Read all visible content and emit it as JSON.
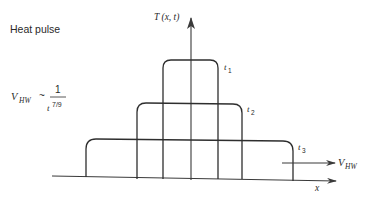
{
  "title": "Heat pulse",
  "formula": {
    "lhs": "V",
    "lhs_sub": "HW",
    "relation": "~",
    "numerator": "1",
    "denominator_base": "t",
    "denominator_exp": "7/9"
  },
  "axes": {
    "y_label": "T (x, t)",
    "x_label": "x"
  },
  "pulses": [
    {
      "label": "t",
      "sub": "1"
    },
    {
      "label": "t",
      "sub": "2"
    },
    {
      "label": "t",
      "sub": "3"
    }
  ],
  "velocity_arrow": {
    "label": "V",
    "sub": "HW"
  }
}
